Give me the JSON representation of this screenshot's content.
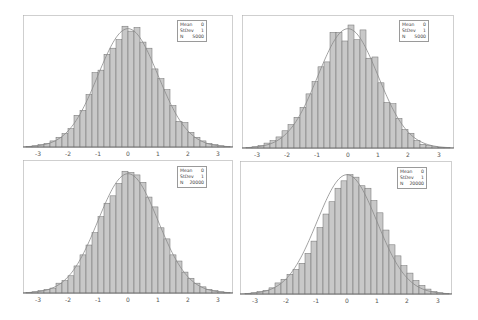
{
  "chart_data": [
    {
      "type": "bar",
      "title": "",
      "xlabel": "",
      "ylabel": "",
      "xlim": [
        -3.5,
        3.5
      ],
      "x_ticks": [
        -3,
        -2,
        -1,
        0,
        1,
        2,
        3
      ],
      "bin_width": 0.2,
      "bin_centers": [
        -3.3,
        -3.1,
        -2.9,
        -2.7,
        -2.5,
        -2.3,
        -2.1,
        -1.9,
        -1.7,
        -1.5,
        -1.3,
        -1.1,
        -0.9,
        -0.7,
        -0.5,
        -0.3,
        -0.1,
        0.1,
        0.3,
        0.5,
        0.7,
        0.9,
        1.1,
        1.3,
        1.5,
        1.7,
        1.9,
        2.1,
        2.3,
        2.5,
        2.7,
        2.9,
        3.1,
        3.3
      ],
      "values_relative": [
        0.005,
        0.01,
        0.02,
        0.03,
        0.05,
        0.08,
        0.11,
        0.15,
        0.26,
        0.3,
        0.43,
        0.61,
        0.63,
        0.76,
        0.81,
        0.88,
        0.99,
        0.95,
        0.98,
        0.86,
        0.81,
        0.64,
        0.56,
        0.47,
        0.34,
        0.21,
        0.2,
        0.12,
        0.08,
        0.05,
        0.03,
        0.02,
        0.01,
        0.005
      ],
      "overlay": "normal density curve",
      "legend": {
        "Mean": "0",
        "StDev": "1",
        "N": "5000"
      },
      "grid": false
    },
    {
      "type": "bar",
      "title": "",
      "xlabel": "",
      "ylabel": "",
      "xlim": [
        -3.5,
        3.5
      ],
      "x_ticks": [
        -3,
        -2,
        -1,
        0,
        1,
        2,
        3
      ],
      "bin_width": 0.2,
      "bin_centers": [
        -3.3,
        -3.1,
        -2.9,
        -2.7,
        -2.5,
        -2.3,
        -2.1,
        -1.9,
        -1.7,
        -1.5,
        -1.3,
        -1.1,
        -0.9,
        -0.7,
        -0.5,
        -0.3,
        -0.1,
        0.1,
        0.3,
        0.5,
        0.7,
        0.9,
        1.1,
        1.3,
        1.5,
        1.7,
        1.9,
        2.1,
        2.3,
        2.5,
        2.7,
        2.9,
        3.1,
        3.3
      ],
      "values_relative": [
        0.005,
        0.01,
        0.02,
        0.04,
        0.06,
        0.09,
        0.14,
        0.19,
        0.25,
        0.33,
        0.44,
        0.54,
        0.66,
        0.7,
        0.94,
        0.94,
        0.87,
        1.0,
        0.88,
        0.96,
        0.73,
        0.74,
        0.53,
        0.37,
        0.36,
        0.24,
        0.15,
        0.12,
        0.06,
        0.03,
        0.02,
        0.01,
        0.005,
        0.003
      ],
      "overlay": "normal density curve",
      "legend": {
        "Mean": "0",
        "StDev": "1",
        "N": "5000"
      },
      "grid": false
    },
    {
      "type": "bar",
      "title": "",
      "xlabel": "",
      "ylabel": "",
      "xlim": [
        -3.5,
        3.5
      ],
      "x_ticks": [
        -3,
        -2,
        -1,
        0,
        1,
        2,
        3
      ],
      "bin_width": 0.2,
      "bin_centers": [
        -3.3,
        -3.1,
        -2.9,
        -2.7,
        -2.5,
        -2.3,
        -2.1,
        -1.9,
        -1.7,
        -1.5,
        -1.3,
        -1.1,
        -0.9,
        -0.7,
        -0.5,
        -0.3,
        -0.1,
        0.1,
        0.3,
        0.5,
        0.7,
        0.9,
        1.1,
        1.3,
        1.5,
        1.7,
        1.9,
        2.1,
        2.3,
        2.5,
        2.7,
        2.9,
        3.1,
        3.3
      ],
      "values_relative": [
        0.005,
        0.01,
        0.02,
        0.03,
        0.04,
        0.08,
        0.1,
        0.14,
        0.22,
        0.31,
        0.39,
        0.49,
        0.62,
        0.73,
        0.79,
        0.89,
        0.99,
        0.98,
        0.96,
        0.9,
        0.78,
        0.7,
        0.53,
        0.44,
        0.31,
        0.26,
        0.17,
        0.12,
        0.08,
        0.05,
        0.03,
        0.02,
        0.01,
        0.005
      ],
      "overlay": "normal density curve",
      "legend": {
        "Mean": "0",
        "StDev": "1",
        "N": "20000"
      },
      "grid": false
    },
    {
      "type": "bar",
      "title": "",
      "xlabel": "",
      "ylabel": "",
      "xlim": [
        -3.5,
        3.5
      ],
      "x_ticks": [
        -3,
        -2,
        -1,
        0,
        1,
        2,
        3
      ],
      "bin_width": 0.2,
      "bin_centers": [
        -3.3,
        -3.1,
        -2.9,
        -2.7,
        -2.5,
        -2.3,
        -2.1,
        -1.9,
        -1.7,
        -1.5,
        -1.3,
        -1.1,
        -0.9,
        -0.7,
        -0.5,
        -0.3,
        -0.1,
        0.1,
        0.3,
        0.5,
        0.7,
        0.9,
        1.1,
        1.3,
        1.5,
        1.7,
        1.9,
        2.1,
        2.3,
        2.5,
        2.7,
        2.9,
        3.1,
        3.3
      ],
      "values_relative": [
        0.005,
        0.01,
        0.02,
        0.03,
        0.05,
        0.09,
        0.12,
        0.16,
        0.2,
        0.25,
        0.33,
        0.43,
        0.54,
        0.65,
        0.75,
        0.86,
        0.92,
        0.97,
        0.95,
        0.88,
        0.86,
        0.76,
        0.66,
        0.52,
        0.4,
        0.31,
        0.23,
        0.17,
        0.11,
        0.07,
        0.04,
        0.02,
        0.01,
        0.005
      ],
      "overlay": "normal density curve",
      "legend": {
        "Mean": "0",
        "StDev": "1",
        "N": "20000"
      },
      "grid": false
    }
  ],
  "panels": [
    {
      "legend": {
        "mean_label": "Mean",
        "mean_value": "0",
        "stdev_label": "StDev",
        "stdev_value": "1",
        "n_label": "N",
        "n_value": "5000"
      }
    },
    {
      "legend": {
        "mean_label": "Mean",
        "mean_value": "0",
        "stdev_label": "StDev",
        "stdev_value": "1",
        "n_label": "N",
        "n_value": "5000"
      }
    },
    {
      "legend": {
        "mean_label": "Mean",
        "mean_value": "0",
        "stdev_label": "StDev",
        "stdev_value": "1",
        "n_label": "N",
        "n_value": "20000"
      }
    },
    {
      "legend": {
        "mean_label": "Mean",
        "mean_value": "0",
        "stdev_label": "StDev",
        "stdev_value": "1",
        "n_label": "N",
        "n_value": "20000"
      }
    }
  ],
  "x_tick_labels": [
    "-3",
    "-2",
    "-1",
    "0",
    "1",
    "2",
    "3"
  ],
  "colors": {
    "bar_fill": "#c8c8c8",
    "bar_stroke": "#6e6e6e",
    "curve": "#8a8a8a",
    "frame": "#b0b0b0"
  }
}
